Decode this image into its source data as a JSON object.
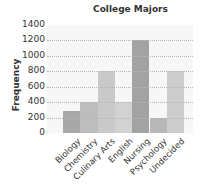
{
  "chart_data": {
    "type": "bar",
    "title": "College Majors",
    "xlabel": "",
    "ylabel": "Frequency",
    "categories": [
      "Biology",
      "Chemistry",
      "Culinary Arts",
      "English",
      "Nursing",
      "Psychology",
      "Undecided"
    ],
    "values": [
      290,
      400,
      800,
      400,
      1200,
      190,
      800
    ],
    "ylim": [
      0,
      1400
    ],
    "yticks": [
      0,
      200,
      400,
      600,
      800,
      1000,
      1200,
      1400
    ],
    "grid": true,
    "legend": null,
    "bar_colors": [
      "#a8a8a8",
      "#bdbdbd",
      "#c9c9c9",
      "#d3d3d3",
      "#a3a3a3",
      "#b8b8b8",
      "#cdcdcd"
    ]
  },
  "yticks_labels": [
    "0",
    "200",
    "400",
    "600",
    "800",
    "1000",
    "1200",
    "1400"
  ]
}
